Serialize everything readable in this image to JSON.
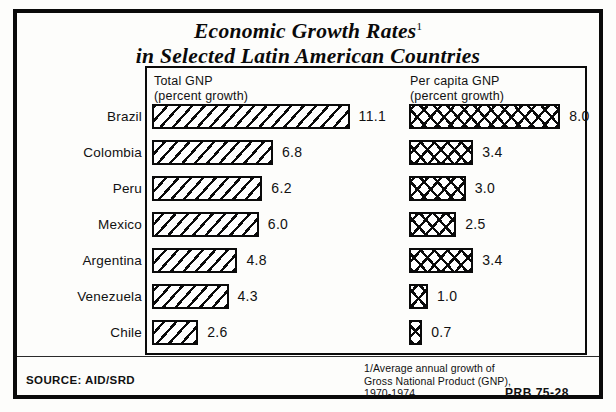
{
  "title": {
    "line1": "Economic Growth Rates",
    "superscript": "1",
    "line2": "in Selected Latin American Countries"
  },
  "panel": {
    "left_header_line1": "Total  GNP",
    "left_header_line2": "(percent  growth)",
    "right_header_line1": "Per capita GNP",
    "right_header_line2": "(percent growth)"
  },
  "footer": {
    "source": "SOURCE: AID/SRD",
    "footnote_line1": "1/Average annual growth of",
    "footnote_line2": "Gross National Product (GNP),",
    "footnote_line3": "1970-1974",
    "code": "PRB 75-28"
  },
  "chart_data": {
    "type": "bar",
    "subtitle": "Average annual growth of Gross National Product (GNP), 1970-1974",
    "orientation": "horizontal",
    "grid": false,
    "legend": "none",
    "xlabel": "percent growth",
    "ylabel": "",
    "categories": [
      "Brazil",
      "Colombia",
      "Peru",
      "Mexico",
      "Argentina",
      "Venezuela",
      "Chile"
    ],
    "series": [
      {
        "name": "Total GNP (percent growth)",
        "values": [
          11.1,
          6.8,
          6.2,
          6.0,
          4.8,
          4.3,
          2.6
        ],
        "labels": [
          "11.1",
          "6.8",
          "6.2",
          "6.0",
          "4.8",
          "4.3",
          "2.6"
        ],
        "pattern": "diagonal-hatch",
        "xlim": [
          0,
          11.1
        ]
      },
      {
        "name": "Per capita GNP (percent growth)",
        "values": [
          8.0,
          3.4,
          3.0,
          2.5,
          3.4,
          1.0,
          0.7
        ],
        "labels": [
          "8.0",
          "3.4",
          "3.0",
          "2.5",
          "3.4",
          "1.0",
          "0.7"
        ],
        "pattern": "cross-hatch",
        "xlim": [
          0,
          8.0
        ]
      }
    ]
  },
  "rows": [
    {
      "country": "Brazil",
      "total": "11.1",
      "capita": "8.0"
    },
    {
      "country": "Colombia",
      "total": "6.8",
      "capita": "3.4"
    },
    {
      "country": "Peru",
      "total": "6.2",
      "capita": "3.0"
    },
    {
      "country": "Mexico",
      "total": "6.0",
      "capita": "2.5"
    },
    {
      "country": "Argentina",
      "total": "4.8",
      "capita": "3.4"
    },
    {
      "country": "Venezuela",
      "total": "4.3",
      "capita": "1.0"
    },
    {
      "country": "Chile",
      "total": "2.6",
      "capita": "0.7"
    }
  ]
}
